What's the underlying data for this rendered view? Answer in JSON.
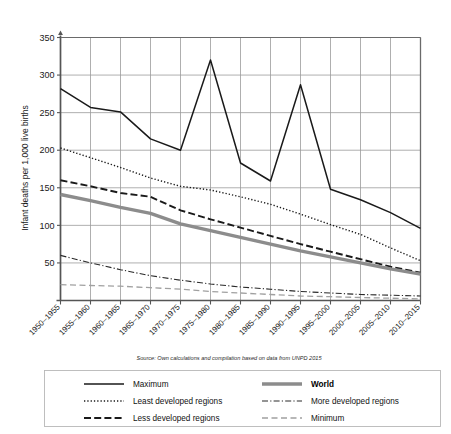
{
  "figure": {
    "source_note": "Source: Own calculations and compilation based on data from UNPD 2015",
    "ylabel": "Infant deaths per 1,000 live births",
    "xlabel": ""
  },
  "axis": {
    "y_ticks": [
      "350",
      "300",
      "250",
      "200",
      "150",
      "100",
      "50"
    ],
    "x_ticks": [
      "1950–1955",
      "1955–1960",
      "1960–1965",
      "1965–1970",
      "1970–1975",
      "1975–1980",
      "1980–1985",
      "1985–1990",
      "1990–1995",
      "1995–2000",
      "2000–2005",
      "2005–2010",
      "2010–2015"
    ]
  },
  "legend": {
    "items": [
      {
        "label": "Maximum",
        "style": "solid-thin",
        "color": "#1a1a1a",
        "bold": false
      },
      {
        "label": "World",
        "style": "solid-thick-gray",
        "color": "#8c8c8c",
        "bold": true
      },
      {
        "label": "Least developed regions",
        "style": "dotted",
        "color": "#1a1a1a",
        "bold": false
      },
      {
        "label": "More developed regions",
        "style": "dashdot",
        "color": "#1a1a1a",
        "bold": false
      },
      {
        "label": "Less developed regions",
        "style": "dashed",
        "color": "#1a1a1a",
        "bold": false
      },
      {
        "label": "Minimum",
        "style": "dashed-gray",
        "color": "#a0a0a0",
        "bold": false
      }
    ]
  },
  "colors": {
    "axis": "#555555",
    "grid": "#9a9a9a",
    "maximum": "#1a1a1a",
    "world": "#8c8c8c",
    "least_developed": "#1a1a1a",
    "less_developed": "#1a1a1a",
    "more_developed": "#2a2a2a",
    "minimum": "#a0a0a0"
  },
  "chart_data": {
    "type": "line",
    "title": "",
    "xlabel": "",
    "ylabel": "Infant deaths per 1,000 live births",
    "ylim": [
      0,
      350
    ],
    "ytick_step": 50,
    "grid": true,
    "legend_position": "bottom",
    "annotations": [
      "Source: Own calculations and compilation based on data from UNPD 2015"
    ],
    "categories": [
      "1950–1955",
      "1955–1960",
      "1960–1965",
      "1965–1970",
      "1970–1975",
      "1975–1980",
      "1980–1985",
      "1985–1990",
      "1990–1995",
      "1995–2000",
      "2000–2005",
      "2005–2010",
      "2010–2015"
    ],
    "series": [
      {
        "name": "Maximum",
        "values": [
          282,
          257,
          251,
          215,
          200,
          320,
          183,
          159,
          287,
          148,
          134,
          117,
          96
        ]
      },
      {
        "name": "Least developed regions",
        "values": [
          203,
          190,
          177,
          163,
          152,
          147,
          138,
          128,
          115,
          101,
          88,
          70,
          53
        ]
      },
      {
        "name": "Less developed regions",
        "values": [
          160,
          152,
          143,
          138,
          120,
          108,
          97,
          86,
          75,
          65,
          55,
          45,
          37
        ]
      },
      {
        "name": "World",
        "values": [
          141,
          133,
          124,
          116,
          102,
          93,
          84,
          75,
          66,
          58,
          50,
          42,
          35
        ]
      },
      {
        "name": "More developed regions",
        "values": [
          60,
          50,
          41,
          33,
          27,
          22,
          18,
          15,
          12,
          10,
          8,
          7,
          6
        ]
      },
      {
        "name": "Minimum",
        "values": [
          21,
          20,
          19,
          17,
          15,
          12,
          10,
          8,
          6,
          5,
          4,
          3,
          2
        ]
      }
    ]
  }
}
